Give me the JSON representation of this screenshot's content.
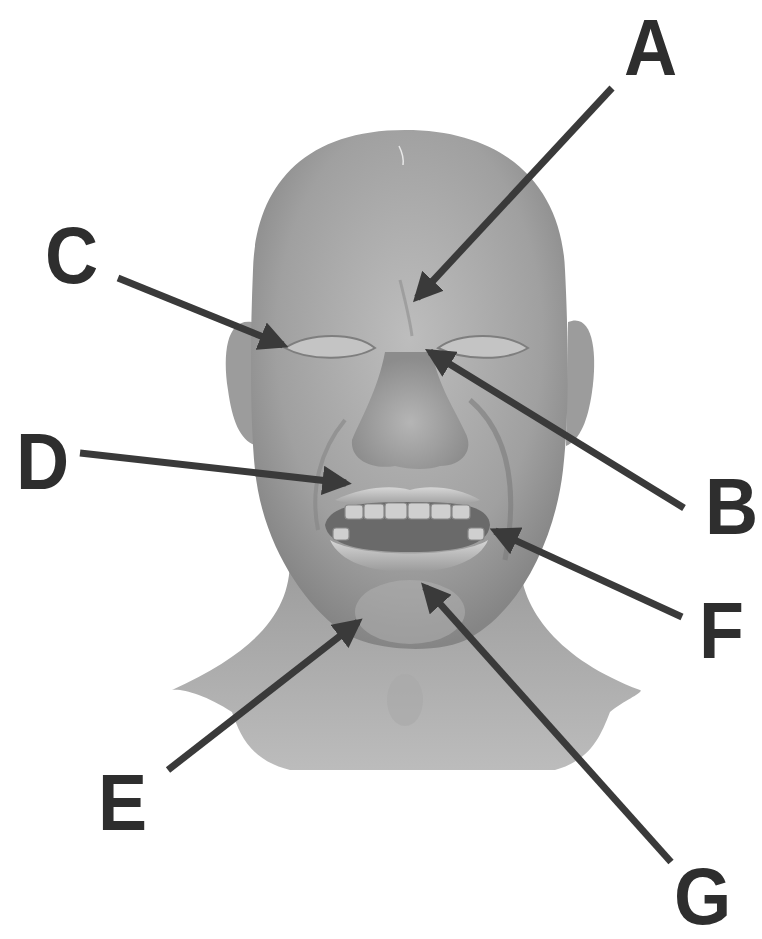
{
  "figure": {
    "colors": {
      "background": "#ffffff",
      "skin_light": "#b9b9b9",
      "skin_mid": "#9a9a9a",
      "skin_dark": "#7a7a7a",
      "arrow": "#3a3a3a",
      "label": "#2e2e2e"
    }
  },
  "labels": [
    {
      "id": "A",
      "text": "A",
      "x": 624,
      "y": 8,
      "arrow": {
        "x1": 612,
        "y1": 88,
        "x2": 417,
        "y2": 298
      }
    },
    {
      "id": "B",
      "text": "B",
      "x": 705,
      "y": 467,
      "arrow": {
        "x1": 684,
        "y1": 508,
        "x2": 430,
        "y2": 352
      }
    },
    {
      "id": "C",
      "text": "C",
      "x": 45,
      "y": 216,
      "arrow": {
        "x1": 118,
        "y1": 278,
        "x2": 283,
        "y2": 345
      }
    },
    {
      "id": "D",
      "text": "D",
      "x": 16,
      "y": 422,
      "arrow": {
        "x1": 80,
        "y1": 453,
        "x2": 346,
        "y2": 483
      }
    },
    {
      "id": "E",
      "text": "E",
      "x": 98,
      "y": 763,
      "arrow": {
        "x1": 168,
        "y1": 770,
        "x2": 358,
        "y2": 622
      }
    },
    {
      "id": "F",
      "text": "F",
      "x": 699,
      "y": 591,
      "arrow": {
        "x1": 682,
        "y1": 617,
        "x2": 495,
        "y2": 531
      }
    },
    {
      "id": "G",
      "text": "G",
      "x": 674,
      "y": 857,
      "arrow": {
        "x1": 671,
        "y1": 862,
        "x2": 425,
        "y2": 587
      }
    }
  ]
}
